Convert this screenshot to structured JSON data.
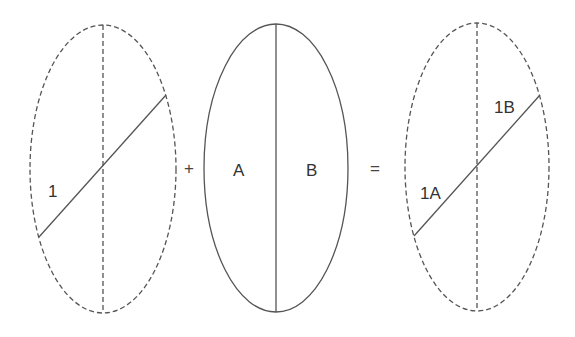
{
  "colors": {
    "stroke": "#555555",
    "text": "#333333",
    "background": "#ffffff"
  },
  "figure": {
    "left": {
      "style": "dashed ellipse",
      "label": "1"
    },
    "plus": "+",
    "middle": {
      "style": "solid ellipse",
      "left_label": "A",
      "right_label": "B"
    },
    "equals": "=",
    "right": {
      "style": "dashed ellipse",
      "lower_label": "1A",
      "upper_label": "1B"
    }
  }
}
